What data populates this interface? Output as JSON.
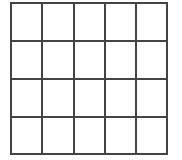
{
  "grid": {
    "rows": 4,
    "cols": 5,
    "line_color": "#444444",
    "background": "#ffffff",
    "h_lines": [
      0,
      38,
      76,
      114,
      151
    ],
    "v_lines": [
      0,
      31,
      63,
      94,
      125,
      156
    ]
  }
}
